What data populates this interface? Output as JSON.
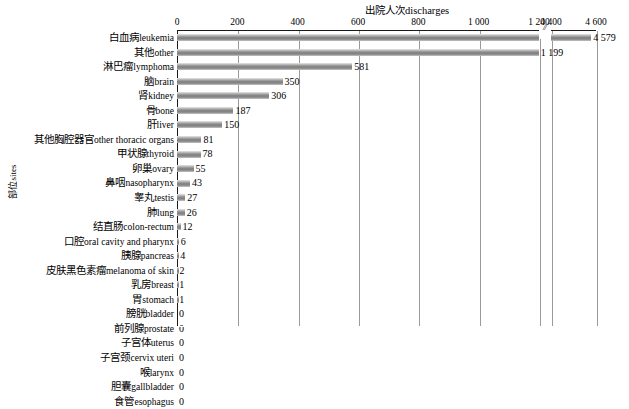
{
  "chart_data": {
    "type": "bar",
    "orientation": "horizontal",
    "title": "出院人次discharges",
    "xlabel": "出院人次discharges",
    "ylabel": "部位sites",
    "grid": true,
    "legend": null,
    "axis_break": {
      "present": true,
      "symbol": "//",
      "before": 1200,
      "after": 4400
    },
    "xticks": [
      "0",
      "200",
      "400",
      "600",
      "800",
      "1 000",
      "1 200",
      "4 400",
      "4 600"
    ],
    "xtick_values": [
      0,
      200,
      400,
      600,
      800,
      1000,
      1200,
      4400,
      4600
    ],
    "xlim": [
      0,
      4600
    ],
    "categories": [
      "白血病leukemia",
      "其他other",
      "淋巴瘤lymphoma",
      "脑brain",
      "肾kidney",
      "骨bone",
      "肝liver",
      "其他胸腔器官other thoracic organs",
      "甲状腺thyroid",
      "卵巢ovary",
      "鼻咽nasopharynx",
      "睾丸testis",
      "肺lung",
      "结直肠colon-rectum",
      "口腔oral cavity and pharynx",
      "胰腺pancreas",
      "皮肤黑色素瘤melanoma of skin",
      "乳房breast",
      "胃stomach",
      "膀胱bladder",
      "前列腺prostate",
      "子宫体uterus",
      "子宫颈cervix uteri",
      "喉larynx",
      "胆囊gallbladder",
      "食管esophagus"
    ],
    "values": [
      4579,
      1199,
      581,
      350,
      306,
      187,
      150,
      81,
      78,
      55,
      43,
      27,
      26,
      12,
      6,
      4,
      2,
      1,
      1,
      0,
      0,
      0,
      0,
      0,
      0,
      0
    ],
    "value_labels": [
      "4 579",
      "1 199",
      "581",
      "350",
      "306",
      "187",
      "150",
      "81",
      "78",
      "55",
      "43",
      "27",
      "26",
      "12",
      "6",
      "4",
      "2",
      "1",
      "1",
      "0",
      "0",
      "0",
      "0",
      "0",
      "0",
      "0"
    ],
    "rows": [
      {
        "cn": "白血病",
        "en": "leukemia",
        "value": 4579,
        "label": "4 579"
      },
      {
        "cn": "其他",
        "en": "other",
        "value": 1199,
        "label": "1 199"
      },
      {
        "cn": "淋巴瘤",
        "en": "lymphoma",
        "value": 581,
        "label": "581"
      },
      {
        "cn": "脑",
        "en": "brain",
        "value": 350,
        "label": "350"
      },
      {
        "cn": "肾",
        "en": "kidney",
        "value": 306,
        "label": "306"
      },
      {
        "cn": "骨",
        "en": "bone",
        "value": 187,
        "label": "187"
      },
      {
        "cn": "肝",
        "en": "liver",
        "value": 150,
        "label": "150"
      },
      {
        "cn": "其他胸腔器官",
        "en": "other thoracic organs",
        "value": 81,
        "label": "81"
      },
      {
        "cn": "甲状腺",
        "en": "thyroid",
        "value": 78,
        "label": "78"
      },
      {
        "cn": "卵巢",
        "en": "ovary",
        "value": 55,
        "label": "55"
      },
      {
        "cn": "鼻咽",
        "en": "nasopharynx",
        "value": 43,
        "label": "43"
      },
      {
        "cn": "睾丸",
        "en": "testis",
        "value": 27,
        "label": "27"
      },
      {
        "cn": "肺",
        "en": "lung",
        "value": 26,
        "label": "26"
      },
      {
        "cn": "结直肠",
        "en": "colon-rectum",
        "value": 12,
        "label": "12"
      },
      {
        "cn": "口腔",
        "en": "oral cavity and pharynx",
        "value": 6,
        "label": "6"
      },
      {
        "cn": "胰腺",
        "en": "pancreas",
        "value": 4,
        "label": "4"
      },
      {
        "cn": "皮肤黑色素瘤",
        "en": "melanoma of skin",
        "value": 2,
        "label": "2"
      },
      {
        "cn": "乳房",
        "en": "breast",
        "value": 1,
        "label": "1"
      },
      {
        "cn": "胃",
        "en": "stomach",
        "value": 1,
        "label": "1"
      },
      {
        "cn": "膀胱",
        "en": "bladder",
        "value": 0,
        "label": "0"
      },
      {
        "cn": "前列腺",
        "en": "prostate",
        "value": 0,
        "label": "0"
      },
      {
        "cn": "子宫体",
        "en": "uterus",
        "value": 0,
        "label": "0"
      },
      {
        "cn": "子宫颈",
        "en": "cervix uteri",
        "value": 0,
        "label": "0"
      },
      {
        "cn": "喉",
        "en": "larynx",
        "value": 0,
        "label": "0"
      },
      {
        "cn": "胆囊",
        "en": "gallbladder",
        "value": 0,
        "label": "0"
      },
      {
        "cn": "食管",
        "en": "esophagus",
        "value": 0,
        "label": "0"
      }
    ],
    "colors": {
      "bar": "#808080",
      "bar_highlight": "#c9c9c9",
      "grid": "#9a9a9a",
      "axis": "#1a1a1a",
      "background": "#ffffff",
      "text": "#000000"
    }
  }
}
